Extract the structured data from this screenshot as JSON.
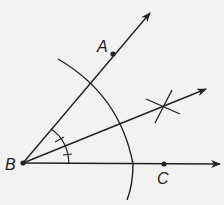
{
  "diagram": {
    "colors": {
      "stroke": "#222222",
      "background": "#f2f2f0"
    },
    "points": [
      {
        "id": "B",
        "label": "B",
        "x": 23,
        "y": 163
      },
      {
        "id": "A",
        "label": "A",
        "x": 113,
        "y": 54
      },
      {
        "id": "C",
        "label": "C",
        "x": 164,
        "y": 164
      }
    ],
    "rays": [
      {
        "name": "ray-BA",
        "from": "B",
        "to_x": 150,
        "to_y": 13
      },
      {
        "name": "ray-BC",
        "from": "B",
        "to_x": 220,
        "to_y": 164
      },
      {
        "name": "bisector-ray",
        "from": "B",
        "to_x": 206,
        "to_y": 89
      }
    ],
    "labels": {
      "A": "A",
      "B": "B",
      "C": "C"
    }
  }
}
